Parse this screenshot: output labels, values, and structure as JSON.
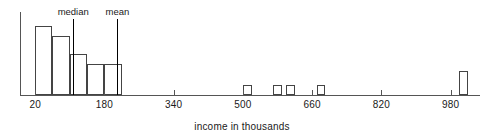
{
  "chart_data": {
    "type": "bar",
    "title": "",
    "subtitle": "",
    "xlabel": "income in thousands",
    "ylabel": "",
    "grid": false,
    "legend": "none",
    "xlim": [
      -15,
      1050
    ],
    "ylim": [
      0,
      24
    ],
    "xticks": [
      20,
      180,
      340,
      500,
      660,
      820,
      980
    ],
    "xtick_labels": [
      "20",
      "180",
      "340",
      "500",
      "660",
      "820",
      "980"
    ],
    "bin_width": 40,
    "bars": [
      {
        "x_left": 20,
        "x_right": 60,
        "height": 20
      },
      {
        "x_left": 60,
        "x_right": 100,
        "height": 17
      },
      {
        "x_left": 100,
        "x_right": 140,
        "height": 12
      },
      {
        "x_left": 140,
        "x_right": 180,
        "height": 9
      },
      {
        "x_left": 180,
        "x_right": 220,
        "height": 9
      },
      {
        "x_left": 500,
        "x_right": 520,
        "height": 3
      },
      {
        "x_left": 570,
        "x_right": 590,
        "height": 3
      },
      {
        "x_left": 600,
        "x_right": 620,
        "height": 3
      },
      {
        "x_left": 670,
        "x_right": 690,
        "height": 3
      },
      {
        "x_left": 1000,
        "x_right": 1020,
        "height": 7
      }
    ],
    "annotations": [
      {
        "name": "median",
        "label": "median",
        "x": 108,
        "value_line_top": 22
      },
      {
        "name": "mean",
        "label": "mean",
        "x": 210,
        "value_line_top": 22
      }
    ]
  }
}
